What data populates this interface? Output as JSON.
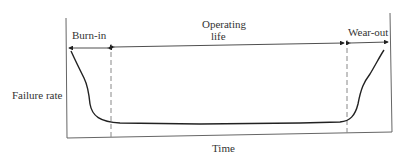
{
  "diagram": {
    "ylabel": "Failure rate",
    "xlabel": "Time",
    "regions": [
      {
        "label": "Burn-in"
      },
      {
        "label_line1": "Operating",
        "label_line2": "life"
      },
      {
        "label": "Wear-out"
      }
    ],
    "colors": {
      "line": "#222222",
      "axis": "#555555",
      "dash": "#777777",
      "text": "#333333"
    }
  }
}
